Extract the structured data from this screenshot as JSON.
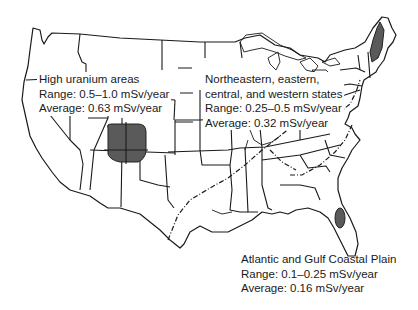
{
  "map": {
    "subject": "Natural background radiation in the United States",
    "regions": [
      {
        "id": "high-uranium",
        "title": "High uranium areas",
        "range": "Range:  0.5–1.0 mSv/year",
        "average": "Average:  0.63 mSv/year",
        "range_msv_per_year": [
          0.5,
          1.0
        ],
        "average_msv_per_year": 0.63,
        "fill_color": "#5a5a5a"
      },
      {
        "id": "northeastern-central-western",
        "title_line1": "Northeastern, eastern,",
        "title_line2": "central, and western states",
        "range": "Range:  0.25–0.5 mSv/year",
        "average": "Average:  0.32 mSv/year",
        "range_msv_per_year": [
          0.25,
          0.5
        ],
        "average_msv_per_year": 0.32
      },
      {
        "id": "atlantic-gulf-coastal-plain",
        "title": "Atlantic and Gulf Coastal Plain",
        "range": "Range:  0.1–0.25 mSv/year",
        "average": "Average:  0.16 mSv/year",
        "range_msv_per_year": [
          0.1,
          0.25
        ],
        "average_msv_per_year": 0.16
      }
    ],
    "colors": {
      "outline": "#1a1a1a",
      "high_area": "#5a5a5a",
      "background": "#ffffff"
    }
  }
}
